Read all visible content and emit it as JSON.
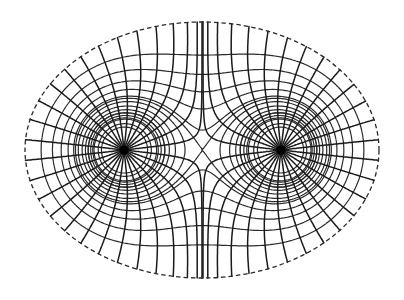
{
  "diagram": {
    "type": "field-line-diagram",
    "background": "#ffffff",
    "ink_color": "#1a1a1a",
    "charges": [
      {
        "id": "left-charge",
        "x": 124,
        "y": 150,
        "q": 1,
        "radius": 4.5
      },
      {
        "id": "right-charge",
        "x": 281,
        "y": 150,
        "q": 1,
        "radius": 4.5
      }
    ],
    "boundary_ellipse": {
      "cx": 202,
      "cy": 150,
      "rx": 177,
      "ry": 128,
      "style": "dashed"
    },
    "field_lines": {
      "per_charge": 28,
      "style": "solid"
    },
    "equipotentials": {
      "count": 11,
      "style": "dashed",
      "includes_saddle_cross": true
    },
    "legend": {
      "solid": "electric field lines",
      "dashed": "equipotential lines"
    }
  }
}
